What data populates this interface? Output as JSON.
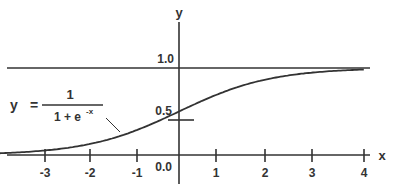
{
  "chart_data": {
    "type": "line",
    "title": "",
    "xlabel": "x",
    "ylabel": "y",
    "formula": {
      "lhs": "y",
      "eq": "=",
      "numerator": "1",
      "denominator_base": "1 + e",
      "denominator_exp": "-x"
    },
    "x_ticks": [
      "-3",
      "-2",
      "-1",
      "1",
      "2",
      "3",
      "4"
    ],
    "y_ticks": [
      "0.0",
      "0.5",
      "1.0"
    ],
    "xlim": [
      -4,
      4
    ],
    "ylim": [
      0,
      1
    ],
    "grid": false,
    "asymptote": 1.0,
    "series": [
      {
        "name": "sigmoid",
        "x": [
          -4,
          -3,
          -2,
          -1,
          0,
          1,
          2,
          3,
          4
        ],
        "y": [
          0.018,
          0.047,
          0.119,
          0.269,
          0.5,
          0.731,
          0.881,
          0.953,
          0.982
        ]
      }
    ]
  },
  "colors": {
    "ink": "#333333",
    "background": "#ffffff"
  }
}
